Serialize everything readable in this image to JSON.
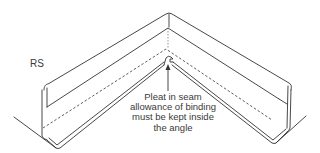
{
  "diagram": {
    "side_label": "RS",
    "annotation": {
      "lines": [
        "Pleat in seam",
        "allowance of binding",
        "must be kept inside",
        "the angle"
      ]
    },
    "colors": {
      "line": "#333333",
      "text": "#3a3a3a",
      "background": "#ffffff"
    }
  }
}
